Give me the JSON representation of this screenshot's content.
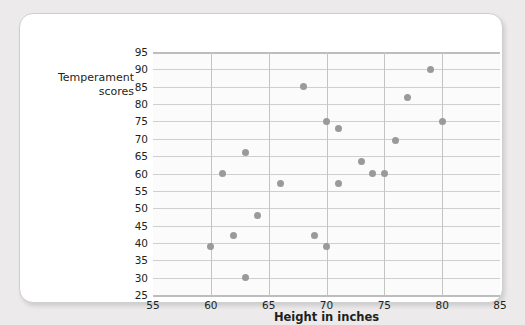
{
  "chart_data": {
    "type": "scatter",
    "title": "",
    "xlabel": "Height in inches",
    "ylabel": "Temperament scores",
    "xlim": [
      55,
      85
    ],
    "ylim": [
      25,
      95
    ],
    "x_ticks": [
      55,
      60,
      65,
      70,
      75,
      80,
      85
    ],
    "y_ticks": [
      25,
      30,
      35,
      40,
      45,
      50,
      55,
      60,
      65,
      70,
      75,
      80,
      85,
      90,
      95
    ],
    "grid": true,
    "legend": "none",
    "point_color": "#9a9a9a",
    "points": [
      {
        "x": 60,
        "y": 39
      },
      {
        "x": 61,
        "y": 60
      },
      {
        "x": 62,
        "y": 42
      },
      {
        "x": 63,
        "y": 66
      },
      {
        "x": 63,
        "y": 30
      },
      {
        "x": 64,
        "y": 48
      },
      {
        "x": 66,
        "y": 57
      },
      {
        "x": 68,
        "y": 85
      },
      {
        "x": 69,
        "y": 42
      },
      {
        "x": 70,
        "y": 39
      },
      {
        "x": 70,
        "y": 75
      },
      {
        "x": 71,
        "y": 73
      },
      {
        "x": 71,
        "y": 57
      },
      {
        "x": 73,
        "y": 63.5
      },
      {
        "x": 74,
        "y": 60
      },
      {
        "x": 75,
        "y": 60
      },
      {
        "x": 76,
        "y": 69.5
      },
      {
        "x": 77,
        "y": 82
      },
      {
        "x": 79,
        "y": 90
      },
      {
        "x": 80,
        "y": 75
      }
    ]
  },
  "labels": {
    "y_axis_title_line1": "Temperament",
    "y_axis_title_line2": "scores",
    "x_axis_title": "Height in inches"
  }
}
